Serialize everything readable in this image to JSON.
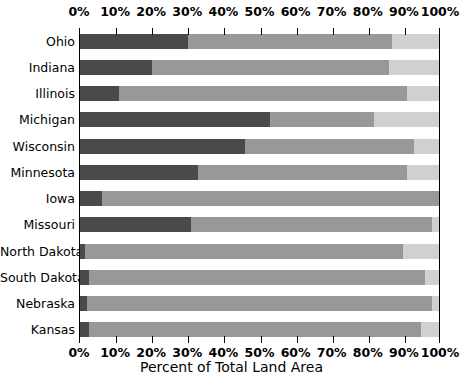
{
  "chart_data": {
    "type": "bar",
    "subtype": "stacked-horizontal-100-percent",
    "title": "",
    "xlabel": "Percent of Total Land Area",
    "ylabel": "",
    "xlim": [
      0,
      100
    ],
    "xticks": [
      0,
      10,
      20,
      30,
      40,
      50,
      60,
      70,
      80,
      90,
      100
    ],
    "xtick_labels": [
      "0%",
      "10%",
      "20%",
      "30%",
      "40%",
      "50%",
      "60%",
      "70%",
      "80%",
      "90%",
      "100%"
    ],
    "grid": false,
    "legend": "none",
    "axis_position": "both-top-and-bottom",
    "categories": [
      "Ohio",
      "Indiana",
      "Illinois",
      "Michigan",
      "Wisconsin",
      "Minnesota",
      "Iowa",
      "Missouri",
      "North Dakota",
      "South Dakota",
      "Nebraska",
      "Kansas"
    ],
    "series": [
      {
        "name": "segment-1",
        "color": "#4a4a4a",
        "values": [
          30,
          20,
          11,
          53,
          46,
          33,
          6,
          31,
          1.5,
          2.5,
          2,
          2.5
        ]
      },
      {
        "name": "segment-2",
        "color": "#989898",
        "values": [
          57,
          66,
          80,
          29,
          47,
          58,
          94,
          67,
          88.5,
          93.5,
          96,
          92.5
        ]
      },
      {
        "name": "segment-3",
        "color": "#d0d0d0",
        "values": [
          13,
          14,
          9,
          18,
          7,
          9,
          0,
          2,
          10,
          4,
          2,
          5
        ]
      }
    ],
    "cumulative_boundaries": [
      [
        30,
        87
      ],
      [
        20,
        86
      ],
      [
        11,
        91
      ],
      [
        53,
        82
      ],
      [
        46,
        93
      ],
      [
        33,
        91
      ],
      [
        6,
        100
      ],
      [
        31,
        98
      ],
      [
        1.5,
        90
      ],
      [
        2.5,
        96
      ],
      [
        2,
        98
      ],
      [
        2.5,
        95
      ]
    ]
  },
  "colors": {
    "segment_dark": "#4a4a4a",
    "segment_mid": "#989898",
    "segment_light": "#d0d0d0",
    "axis": "#000000",
    "background": "#ffffff"
  }
}
